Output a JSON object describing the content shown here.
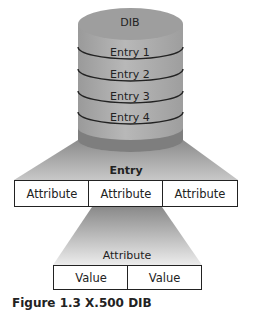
{
  "cylinder": {
    "title": "DIB",
    "entries": [
      "Entry 1",
      "Entry 2",
      "Entry 3",
      "Entry 4"
    ]
  },
  "entry": {
    "title": "Entry",
    "attributes": [
      "Attribute",
      "Attribute",
      "Attribute"
    ]
  },
  "attribute": {
    "title": "Attribute",
    "values": [
      "Value",
      "Value"
    ]
  },
  "caption": "Figure 1.3  X.500 DIB",
  "colors": {
    "cylinder_body": "#a9a9a9",
    "cylinder_top": "#9c9c9c",
    "fan_dark": "#8a8a8a",
    "fan_light": "#e6e6e6",
    "outline": "#222222"
  }
}
